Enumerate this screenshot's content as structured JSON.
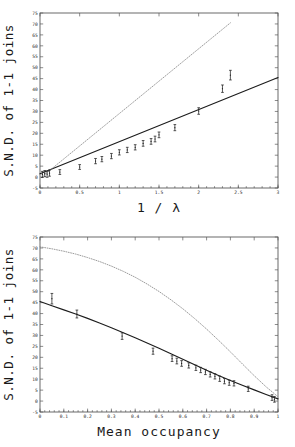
{
  "chart_data": [
    {
      "id": "top",
      "type": "scatter",
      "title": "",
      "xlabel": "1 / λ",
      "ylabel": "S.N.D. of 1-1 joins",
      "xlim": [
        0,
        3
      ],
      "ylim": [
        -5,
        75
      ],
      "xticks": [
        0,
        0.5,
        1,
        1.5,
        2,
        2.5,
        3
      ],
      "xticklabels": [
        "0",
        "0.5",
        "1",
        "1.5",
        "2",
        "2.5",
        "3"
      ],
      "xminorstep": 0.1,
      "yticks": [
        -5,
        0,
        5,
        10,
        15,
        20,
        25,
        30,
        35,
        40,
        45,
        50,
        55,
        60,
        65,
        70,
        75
      ],
      "yticklabels": [
        "-5",
        "0",
        "5",
        "10",
        "15",
        "20",
        "25",
        "30",
        "35",
        "40",
        "45",
        "50",
        "55",
        "60",
        "65",
        "70",
        "75"
      ],
      "grid": false,
      "legend": "none",
      "series": [
        {
          "name": "solid fitted line",
          "style": "solid-line",
          "color": "#1c1c1c",
          "x": [
            0,
            3
          ],
          "y": [
            1.5,
            45.5
          ]
        },
        {
          "name": "dotted reference line",
          "style": "dotted-line",
          "color": "#8a8a8a",
          "x": [
            0.03,
            2.4
          ],
          "y": [
            0.3,
            70.5
          ]
        },
        {
          "name": "observed points with error bars",
          "style": "errorbar-points",
          "color": "#232323",
          "x": [
            0.03,
            0.06,
            0.09,
            0.12,
            0.25,
            0.5,
            0.7,
            0.78,
            0.9,
            1.0,
            1.1,
            1.2,
            1.3,
            1.4,
            1.45,
            1.5,
            1.7,
            2.0,
            2.3,
            2.4
          ],
          "y": [
            1.2,
            1.6,
            1.3,
            1.8,
            2.3,
            4.6,
            7.3,
            8.2,
            9.6,
            11.3,
            12.4,
            13.6,
            15.4,
            16.3,
            17.4,
            19.3,
            22.6,
            30.2,
            40.4,
            46.6
          ],
          "yerr": [
            1.4,
            1.4,
            1.4,
            1.4,
            1.1,
            1.1,
            1.2,
            1.2,
            1.2,
            1.2,
            1.2,
            1.2,
            1.3,
            1.3,
            1.3,
            1.3,
            1.4,
            1.5,
            1.7,
            2.2
          ]
        }
      ]
    },
    {
      "id": "bottom",
      "type": "scatter",
      "title": "",
      "xlabel": "Mean occupancy",
      "ylabel": "S.N.D. of 1-1 joins",
      "xlim": [
        0,
        1
      ],
      "ylim": [
        -5,
        75
      ],
      "xticks": [
        0,
        0.1,
        0.2,
        0.3,
        0.4,
        0.5,
        0.6,
        0.7,
        0.8,
        0.9,
        1
      ],
      "xticklabels": [
        "0",
        "0.1",
        "0.2",
        "0.3",
        "0.4",
        "0.5",
        "0.6",
        "0.7",
        "0.8",
        "0.9",
        "1"
      ],
      "xminorstep": 0.02,
      "yticks": [
        -5,
        0,
        5,
        10,
        15,
        20,
        25,
        30,
        35,
        40,
        45,
        50,
        55,
        60,
        65,
        70,
        75
      ],
      "yticklabels": [
        "-5",
        "0",
        "5",
        "10",
        "15",
        "20",
        "25",
        "30",
        "35",
        "40",
        "45",
        "50",
        "55",
        "60",
        "65",
        "70",
        "75"
      ],
      "grid": false,
      "legend": "none",
      "series": [
        {
          "name": "solid fitted curve",
          "style": "solid-curve",
          "color": "#1c1c1c",
          "x": [
            0.0,
            0.05,
            0.1,
            0.15,
            0.2,
            0.25,
            0.3,
            0.35,
            0.4,
            0.45,
            0.5,
            0.55,
            0.6,
            0.65,
            0.7,
            0.75,
            0.8,
            0.85,
            0.9,
            0.95,
            1.0
          ],
          "y": [
            45.5,
            43.6,
            41.7,
            39.8,
            37.8,
            35.7,
            33.5,
            31.2,
            28.9,
            26.5,
            24.1,
            21.6,
            19.1,
            16.6,
            14.1,
            11.7,
            9.4,
            7.2,
            5.1,
            3.0,
            1.0
          ]
        },
        {
          "name": "dotted reference curve",
          "style": "dotted-curve",
          "color": "#8a8a8a",
          "x": [
            0.0,
            0.05,
            0.1,
            0.15,
            0.2,
            0.25,
            0.3,
            0.35,
            0.4,
            0.45,
            0.5,
            0.55,
            0.6,
            0.65,
            0.7,
            0.75,
            0.8,
            0.85,
            0.9,
            0.95,
            1.0
          ],
          "y": [
            70.5,
            69.6,
            68.5,
            67.2,
            65.6,
            63.8,
            61.7,
            59.3,
            56.6,
            53.5,
            50.1,
            46.3,
            42.2,
            37.7,
            32.9,
            27.8,
            22.5,
            17.0,
            11.6,
            6.5,
            2.0
          ]
        },
        {
          "name": "observed points with error bars",
          "style": "errorbar-points",
          "color": "#232323",
          "x": [
            0.05,
            0.155,
            0.345,
            0.475,
            0.555,
            0.575,
            0.595,
            0.625,
            0.655,
            0.675,
            0.695,
            0.715,
            0.735,
            0.755,
            0.775,
            0.795,
            0.815,
            0.875,
            0.975,
            0.985
          ],
          "y": [
            46.8,
            39.8,
            29.7,
            22.8,
            19.4,
            18.3,
            17.2,
            16.3,
            15.2,
            14.2,
            13.3,
            12.2,
            11.3,
            10.2,
            9.1,
            8.4,
            8.1,
            5.6,
            1.6,
            0.8
          ],
          "yerr": [
            2.4,
            1.8,
            1.5,
            1.4,
            1.3,
            1.3,
            1.3,
            1.2,
            1.2,
            1.2,
            1.2,
            1.2,
            1.2,
            1.2,
            1.2,
            1.2,
            1.2,
            1.2,
            1.3,
            1.3
          ]
        }
      ]
    }
  ],
  "artifact": {
    "text": ""
  }
}
